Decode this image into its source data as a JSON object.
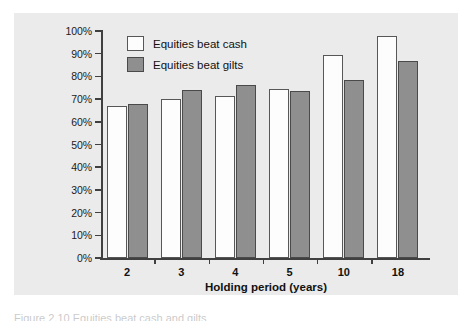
{
  "figure": {
    "caption": "Figure 2.10 Equities beat cash and gilts"
  },
  "legend": {
    "position": "top-left inside plot",
    "items": [
      {
        "label": "Equities beat cash",
        "swatch": "white-square-icon",
        "color": "#ffffff"
      },
      {
        "label": "Equities beat gilts",
        "swatch": "gray-square-icon",
        "color": "#8f8f8f"
      }
    ]
  },
  "chart_data": {
    "type": "bar",
    "title": "",
    "xlabel": "Holding period (years)",
    "ylabel": "",
    "categories": [
      "2",
      "3",
      "4",
      "5",
      "10",
      "18"
    ],
    "series": [
      {
        "name": "Equities beat cash",
        "values": [
          67,
          70,
          71.5,
          74.5,
          89.5,
          98
        ]
      },
      {
        "name": "Equities beat gilts",
        "values": [
          68,
          74,
          76,
          73.5,
          78.5,
          87
        ]
      }
    ],
    "ylim": [
      0,
      100
    ],
    "ytick_values": [
      0,
      10,
      20,
      30,
      40,
      50,
      60,
      70,
      80,
      90,
      100
    ],
    "ytick_labels": [
      "0%",
      "10%",
      "20%",
      "30%",
      "40%",
      "50%",
      "60%",
      "70%",
      "80%",
      "90%",
      "100%"
    ],
    "grid": false,
    "legend_position": "upper left"
  },
  "colors": {
    "panel_background": "#ebebeb",
    "page_background": "#ffffff",
    "axis": "#404040",
    "bar_cash": "#fdfdfd",
    "bar_gilts": "#8f8f8f",
    "text": "#111111"
  }
}
